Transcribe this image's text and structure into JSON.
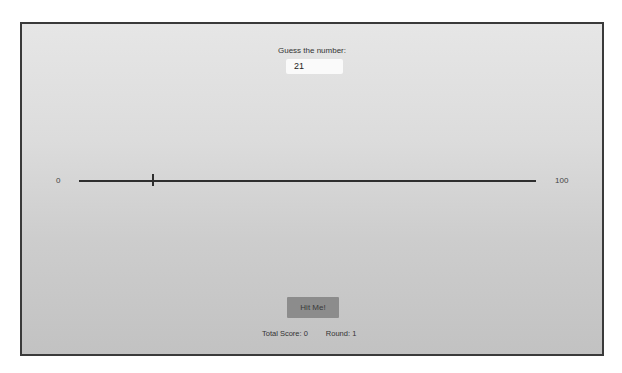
{
  "game": {
    "prompt": "Guess the number:",
    "guess_value": "21",
    "slider": {
      "min_label": "0",
      "max_label": "100",
      "value": 16
    },
    "hit_button_label": "Hit Me!",
    "total_score_label": "Total Score: 0",
    "round_label": "Round: 1"
  },
  "colors": {
    "frame_border": "#3a3a3a",
    "button_bg": "#8c8c8c",
    "track": "#2e2e2e"
  }
}
